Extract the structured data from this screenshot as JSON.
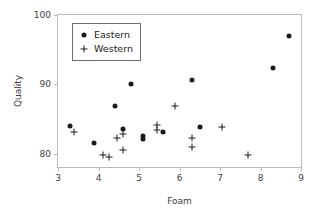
{
  "chart_data": {
    "type": "scatter",
    "title": "",
    "xlabel": "Foam",
    "ylabel": "Quality",
    "xlim": [
      3,
      9
    ],
    "ylim": [
      78.1,
      100
    ],
    "xticks": [
      3,
      4,
      5,
      6,
      7,
      8,
      9
    ],
    "yticks": [
      80,
      90,
      100
    ],
    "xtick_labels": [
      "3",
      "4",
      "5",
      "6",
      "7",
      "8",
      "9"
    ],
    "ytick_labels": [
      "80",
      "90",
      "100"
    ],
    "grid": false,
    "legend_position": "upper left",
    "series": [
      {
        "name": "Eastern",
        "marker": "filled-circle",
        "color": "#1a1a1a",
        "points": [
          {
            "x": 3.3,
            "y": 84.0
          },
          {
            "x": 3.9,
            "y": 81.5
          },
          {
            "x": 4.4,
            "y": 86.9
          },
          {
            "x": 4.6,
            "y": 83.6
          },
          {
            "x": 4.8,
            "y": 90.0
          },
          {
            "x": 5.1,
            "y": 82.6
          },
          {
            "x": 5.1,
            "y": 82.1
          },
          {
            "x": 5.6,
            "y": 83.2
          },
          {
            "x": 6.3,
            "y": 90.7
          },
          {
            "x": 6.5,
            "y": 83.8
          },
          {
            "x": 8.3,
            "y": 92.4
          },
          {
            "x": 8.7,
            "y": 97.0
          }
        ]
      },
      {
        "name": "Western",
        "marker": "plus",
        "color": "#1a1a1a",
        "points": [
          {
            "x": 3.4,
            "y": 83.1
          },
          {
            "x": 4.1,
            "y": 79.9
          },
          {
            "x": 4.25,
            "y": 79.5
          },
          {
            "x": 4.45,
            "y": 82.3
          },
          {
            "x": 4.6,
            "y": 82.8
          },
          {
            "x": 4.6,
            "y": 80.5
          },
          {
            "x": 5.45,
            "y": 84.1
          },
          {
            "x": 5.45,
            "y": 83.4
          },
          {
            "x": 5.9,
            "y": 86.9
          },
          {
            "x": 6.3,
            "y": 82.3
          },
          {
            "x": 6.3,
            "y": 81.0
          },
          {
            "x": 7.05,
            "y": 83.9
          },
          {
            "x": 7.7,
            "y": 79.8
          }
        ]
      }
    ],
    "legend": [
      {
        "label": "Eastern",
        "marker": "filled-circle"
      },
      {
        "label": "Western",
        "marker": "plus"
      }
    ]
  }
}
